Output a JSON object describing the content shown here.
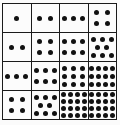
{
  "figure": {
    "rows": 4,
    "cols": 4,
    "dot_color": "#121212",
    "line_color": "#1b1b1b",
    "background": "#fbfbfb",
    "cell_background": "#fcfcfc",
    "cells": [
      {
        "row": 1,
        "col": 1,
        "count": 1,
        "dot_rows": [
          1
        ]
      },
      {
        "row": 1,
        "col": 2,
        "count": 2,
        "dot_rows": [
          2
        ]
      },
      {
        "row": 1,
        "col": 3,
        "count": 3,
        "dot_rows": [
          3
        ]
      },
      {
        "row": 1,
        "col": 4,
        "count": 4,
        "dot_rows": [
          2,
          2
        ]
      },
      {
        "row": 2,
        "col": 1,
        "count": 2,
        "dot_rows": [
          2
        ]
      },
      {
        "row": 2,
        "col": 2,
        "count": 4,
        "dot_rows": [
          2,
          2
        ]
      },
      {
        "row": 2,
        "col": 3,
        "count": 6,
        "dot_rows": [
          3,
          3
        ]
      },
      {
        "row": 2,
        "col": 4,
        "count": 8,
        "dot_rows": [
          3,
          2,
          3
        ]
      },
      {
        "row": 3,
        "col": 1,
        "count": 3,
        "dot_rows": [
          3
        ]
      },
      {
        "row": 3,
        "col": 2,
        "count": 6,
        "dot_rows": [
          3,
          3
        ]
      },
      {
        "row": 3,
        "col": 3,
        "count": 9,
        "dot_rows": [
          3,
          3,
          3
        ]
      },
      {
        "row": 3,
        "col": 4,
        "count": 12,
        "dot_rows": [
          4,
          4,
          4
        ]
      },
      {
        "row": 4,
        "col": 1,
        "count": 4,
        "dot_rows": [
          2,
          2
        ]
      },
      {
        "row": 4,
        "col": 2,
        "count": 8,
        "dot_rows": [
          3,
          2,
          3
        ]
      },
      {
        "row": 4,
        "col": 3,
        "count": 16,
        "dot_rows": [
          4,
          4,
          4,
          4
        ]
      },
      {
        "row": 4,
        "col": 4,
        "count": 16,
        "dot_rows": [
          4,
          4,
          4,
          4
        ]
      }
    ]
  }
}
